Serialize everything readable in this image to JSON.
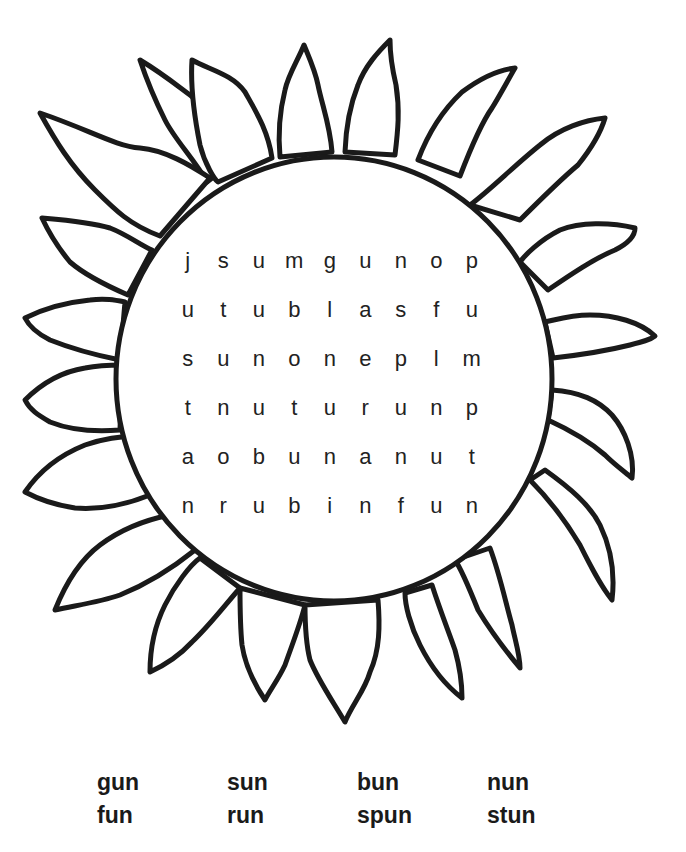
{
  "puzzle": {
    "grid": [
      [
        "j",
        "s",
        "u",
        "m",
        "g",
        "u",
        "n",
        "o",
        "p"
      ],
      [
        "u",
        "t",
        "u",
        "b",
        "l",
        "a",
        "s",
        "f",
        "u"
      ],
      [
        "s",
        "u",
        "n",
        "o",
        "n",
        "e",
        "p",
        "l",
        "m"
      ],
      [
        "t",
        "n",
        "u",
        "t",
        "u",
        "r",
        "u",
        "n",
        "p"
      ],
      [
        "a",
        "o",
        "b",
        "u",
        "n",
        "a",
        "n",
        "u",
        "t"
      ],
      [
        "n",
        "r",
        "u",
        "b",
        "i",
        "n",
        "f",
        "u",
        "n"
      ]
    ]
  },
  "word_bank": {
    "rows": [
      [
        "gun",
        "sun",
        "bun",
        "nun"
      ],
      [
        "fun",
        "run",
        "spun",
        "stun"
      ]
    ]
  },
  "art": {
    "stroke_color": "#1a1a1a",
    "background": "#ffffff"
  }
}
